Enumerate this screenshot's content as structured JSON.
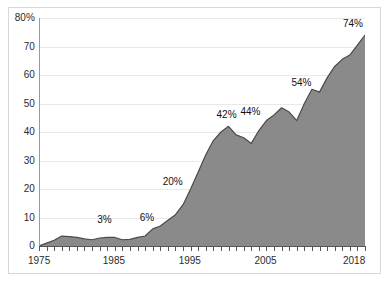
{
  "chart_data": {
    "type": "area",
    "title": "",
    "subtitle": "",
    "xlabel": "",
    "ylabel": "",
    "xlim": [
      1975,
      2018
    ],
    "ylim": [
      0,
      80
    ],
    "grid": true,
    "legend": null,
    "fill_color": "#8a8a8a",
    "line_color": "#4a4a4a",
    "background_color": "#ffffff",
    "gridline_color": "#e9e9e9",
    "x": [
      1975,
      1976,
      1977,
      1978,
      1979,
      1980,
      1981,
      1982,
      1983,
      1984,
      1985,
      1986,
      1987,
      1988,
      1989,
      1990,
      1991,
      1992,
      1993,
      1994,
      1995,
      1996,
      1997,
      1998,
      1999,
      2000,
      2001,
      2002,
      2003,
      2004,
      2005,
      2006,
      2007,
      2008,
      2009,
      2010,
      2011,
      2012,
      2013,
      2014,
      2015,
      2016,
      2017,
      2018
    ],
    "values": [
      0,
      1,
      2,
      3.5,
      3.3,
      3,
      2.5,
      2.2,
      2.8,
      3,
      3,
      2.2,
      2.3,
      3,
      3.5,
      6,
      7,
      9,
      11,
      14.5,
      20,
      26,
      32,
      37,
      40,
      42,
      39,
      38,
      36,
      40.5,
      44,
      46,
      48.5,
      47,
      44,
      50,
      55,
      54,
      59,
      63,
      65.5,
      67,
      70.5,
      74
    ],
    "x_tick_labels": [
      "1975",
      "1985",
      "1995",
      "2005",
      "2018"
    ],
    "x_tick_values": [
      1975,
      1985,
      1995,
      2005,
      2018
    ],
    "y_tick_labels": [
      "80%",
      "70",
      "60",
      "50",
      "40",
      "30",
      "20",
      "10",
      "0"
    ],
    "y_tick_values": [
      80,
      70,
      60,
      50,
      40,
      30,
      20,
      10,
      0
    ],
    "annotations": [
      {
        "label": "3%",
        "x": 1984,
        "y": 3
      },
      {
        "label": "6%",
        "x": 1990,
        "y": 6
      },
      {
        "label": "20%",
        "x": 1995,
        "y": 20
      },
      {
        "label": "42%",
        "x": 2000,
        "y": 42
      },
      {
        "label": "44%",
        "x": 2005,
        "y": 44
      },
      {
        "label": "54%",
        "x": 2012,
        "y": 54
      },
      {
        "label": "74%",
        "x": 2018,
        "y": 74
      }
    ]
  }
}
